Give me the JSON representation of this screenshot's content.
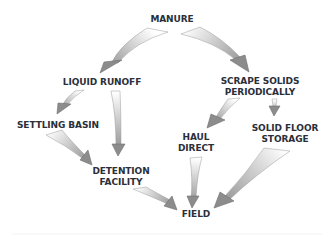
{
  "diagram": {
    "type": "flowchart",
    "colors": {
      "text": "#2a2f3a",
      "arrow_head": "#8c8c8c",
      "arrow_tail": "#ffffff",
      "arrow_edge": "#6e6e6e",
      "background": "#ffffff"
    },
    "nodes": [
      {
        "id": "manure",
        "line1": "MANURE",
        "line2": ""
      },
      {
        "id": "liquid-runoff",
        "line1": "LIQUID RUNOFF",
        "line2": ""
      },
      {
        "id": "scrape-solids",
        "line1": "SCRAPE SOLIDS",
        "line2": "PERIODICALLY"
      },
      {
        "id": "settling-basin",
        "line1": "SETTLING BASIN",
        "line2": ""
      },
      {
        "id": "haul-direct",
        "line1": "HAUL",
        "line2": "DIRECT"
      },
      {
        "id": "solid-floor-storage",
        "line1": "SOLID FLOOR",
        "line2": "STORAGE"
      },
      {
        "id": "detention-facility",
        "line1": "DETENTION",
        "line2": "FACILITY"
      },
      {
        "id": "field",
        "line1": "FIELD",
        "line2": ""
      }
    ],
    "edges": [
      {
        "from": "MANURE",
        "to": "LIQUID RUNOFF"
      },
      {
        "from": "MANURE",
        "to": "SCRAPE SOLIDS PERIODICALLY"
      },
      {
        "from": "LIQUID RUNOFF",
        "to": "SETTLING BASIN"
      },
      {
        "from": "LIQUID RUNOFF",
        "to": "DETENTION FACILITY"
      },
      {
        "from": "SETTLING BASIN",
        "to": "DETENTION FACILITY"
      },
      {
        "from": "SCRAPE SOLIDS PERIODICALLY",
        "to": "HAUL DIRECT"
      },
      {
        "from": "SCRAPE SOLIDS PERIODICALLY",
        "to": "SOLID FLOOR STORAGE"
      },
      {
        "from": "HAUL DIRECT",
        "to": "FIELD"
      },
      {
        "from": "SOLID FLOOR STORAGE",
        "to": "FIELD"
      },
      {
        "from": "DETENTION FACILITY",
        "to": "FIELD"
      }
    ]
  }
}
